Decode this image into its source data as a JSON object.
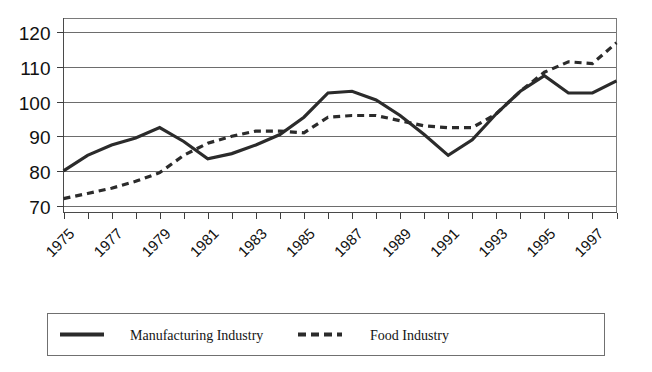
{
  "chart_data": {
    "type": "line",
    "title": "",
    "subtitle": "",
    "xlabel": "",
    "ylabel": "",
    "x": [
      1975,
      1976,
      1977,
      1978,
      1979,
      1980,
      1981,
      1982,
      1983,
      1984,
      1985,
      1986,
      1987,
      1988,
      1989,
      1990,
      1991,
      1992,
      1993,
      1994,
      1995,
      1996,
      1997,
      1998
    ],
    "xtick_labels": [
      "1975",
      "1977",
      "1979",
      "1981",
      "1983",
      "1985",
      "1987",
      "1989",
      "1991",
      "1993",
      "1995",
      "1997"
    ],
    "xtick_values": [
      1975,
      1977,
      1979,
      1981,
      1983,
      1985,
      1987,
      1989,
      1991,
      1993,
      1995,
      1997
    ],
    "xtick_rotation_deg": 45,
    "ytick_labels": [
      "70",
      "80",
      "90",
      "100",
      "110",
      "120"
    ],
    "ytick_values": [
      70,
      80,
      90,
      100,
      110,
      120
    ],
    "xlim": [
      1975,
      1998
    ],
    "ylim": [
      68,
      124
    ],
    "grid": "horizontal",
    "legend_position": "bottom",
    "series": [
      {
        "name": "Manufacturing Industry",
        "style": "solid",
        "color": "#2b2b2b",
        "values": [
          80.0,
          84.5,
          87.5,
          89.5,
          92.5,
          88.5,
          83.5,
          85.0,
          87.5,
          90.5,
          95.5,
          102.5,
          103.0,
          100.5,
          96.0,
          90.5,
          84.5,
          89.0,
          96.5,
          103.0,
          107.5,
          102.5,
          102.5,
          106.0
        ]
      },
      {
        "name": "Food Industry",
        "style": "dashed",
        "color": "#2b2b2b",
        "values": [
          72.0,
          73.5,
          75.0,
          77.0,
          79.5,
          84.5,
          88.0,
          90.0,
          91.5,
          91.5,
          91.0,
          95.5,
          96.0,
          96.0,
          94.5,
          93.0,
          92.5,
          92.5,
          96.5,
          103.0,
          108.5,
          111.5,
          111.0,
          117.0
        ]
      }
    ],
    "legend": [
      {
        "label": "Manufacturing Industry",
        "style": "solid"
      },
      {
        "label": "Food Industry",
        "style": "dashed"
      }
    ]
  },
  "legend": {
    "manufacturing_label": "Manufacturing Industry",
    "food_label": "Food Industry"
  },
  "colors": {
    "line": "#2b2b2b",
    "grid": "#6d6d6d",
    "axis": "#4a4a4a",
    "text": "#111111",
    "background": "#ffffff"
  }
}
